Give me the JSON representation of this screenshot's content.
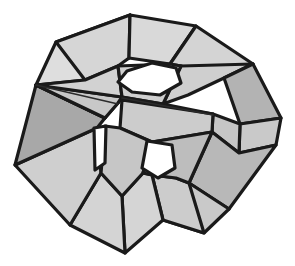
{
  "figure": {
    "kind": "polyhedron-diagram",
    "canvas": {
      "width": 295,
      "height": 266
    },
    "palette": {
      "background": "#ffffff",
      "edge": "#1a1a1a",
      "thin_edge": "#2b2b2b",
      "hole": "#ffffff",
      "shade_light": "#dedede",
      "shade_mid": "#d2d2d2",
      "shade_medium": "#c4c4c4",
      "shade_dark": "#ababab",
      "shade_darker": "#9e9e9e"
    },
    "style": {
      "edge_width": 3.2,
      "thin_edge_width": 1.6,
      "fill_opacity": 1
    },
    "faces": [
      {
        "name": "top-left-upper-band",
        "shade": "#dedede",
        "points": "56,42 130,15 129,58 85,80 36,85"
      },
      {
        "name": "top-crown-left",
        "shade": "#d6d6d6",
        "points": "130,15 129,58 118,66 85,80 56,42"
      },
      {
        "name": "top-crown-center",
        "shade": "#d9d9d9",
        "points": "130,15 196,26 170,64 129,58"
      },
      {
        "name": "top-crown-right",
        "shade": "#d4d4d4",
        "points": "196,26 253,64 224,78 181,66 170,64"
      },
      {
        "name": "upper-right-wedge",
        "shade": "#cfcfcf",
        "points": "253,64 224,78 188,95 163,104 181,66"
      },
      {
        "name": "right-upper-face",
        "shade": "#b3b3b3",
        "points": "253,64 281,118 240,124 224,78"
      },
      {
        "name": "right-lower-face",
        "shade": "#c9c9c9",
        "points": "281,118 276,145 239,153 240,124"
      },
      {
        "name": "right-mid-triangle",
        "shade": "#c6c6c6",
        "points": "240,124 239,153 212,132 213,114"
      },
      {
        "name": "lower-right-big",
        "shade": "#b8b8b8",
        "points": "239,153 276,145 229,209 189,183 212,132"
      },
      {
        "name": "lower-right-fan",
        "shade": "#c9c9c9",
        "points": "229,209 189,183 176,178 163,220 204,233"
      },
      {
        "name": "bottom-right-wedge",
        "shade": "#cccccc",
        "points": "204,233 163,220 152,175 176,178 189,183"
      },
      {
        "name": "bottom-center-wedge",
        "shade": "#d5d5d5",
        "points": "163,220 125,253 122,196 143,173 152,175"
      },
      {
        "name": "bottom-left-wedge",
        "shade": "#d4d4d4",
        "points": "125,253 70,225 101,173 122,196"
      },
      {
        "name": "lower-left-big",
        "shade": "#cfcfcf",
        "points": "70,225 15,165 97,128 101,173"
      },
      {
        "name": "left-dark-face",
        "shade": "#a8a8a8",
        "points": "15,165 36,85 105,118 97,128"
      },
      {
        "name": "left-sliver-upper",
        "shade": "#d0d0d0",
        "points": "36,85 122,97 118,103 105,118"
      },
      {
        "name": "left-sliver-lower",
        "shade": "#c8c8c8",
        "points": "36,85 105,118 118,103 122,97"
      },
      {
        "name": "inner-left-panel",
        "shade": "#d2d2d2",
        "points": "85,80 118,66 122,97 36,85"
      },
      {
        "name": "inner-top-right-panel",
        "shade": "#d0d0d0",
        "points": "170,64 181,66 163,104 122,97 118,66"
      },
      {
        "name": "inner-ridge-upper",
        "shade": "#dadada",
        "points": "122,97 163,104 213,114 122,100"
      },
      {
        "name": "inner-ridge-lower",
        "shade": "#cccccc",
        "points": "122,100 213,114 212,132 152,142 120,128"
      },
      {
        "name": "inner-pillar-left",
        "shade": "#c6c6c6",
        "points": "120,128 152,142 143,173 122,196 101,173 105,126"
      },
      {
        "name": "inner-pillar-right",
        "shade": "#bdbdbd",
        "points": "152,142 212,132 189,183 176,178 152,175 143,173"
      }
    ],
    "holes": [
      {
        "name": "upper-central-hole",
        "shape": "hexagon",
        "points": "127,71 152,63 176,68 181,83 160,95 132,92 118,82"
      },
      {
        "name": "lower-central-hole",
        "shape": "pentagon",
        "points": "147,141 172,145 175,168 158,178 142,168"
      },
      {
        "name": "left-sliver-hole",
        "shape": "quadrilateral",
        "points": "94,128 106,126 105,163 95,170"
      }
    ],
    "thin_edges": [
      {
        "name": "inner-ridge-crease",
        "points": "122,98 213,115"
      },
      {
        "name": "left-sliver-crease",
        "points": "36,85 118,104"
      }
    ]
  }
}
